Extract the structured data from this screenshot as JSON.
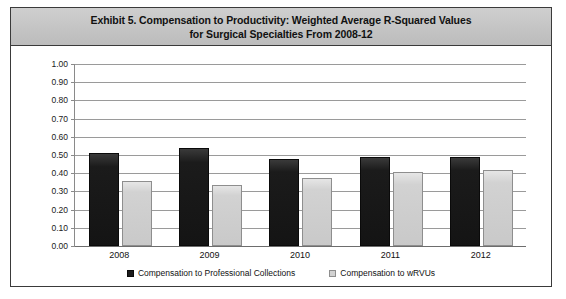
{
  "exhibit": {
    "title_line_1": "Exhibit 5. Compensation to Productivity: Weighted Average R-Squared Values",
    "title_line_2": "for Surgical Specialties From 2008-12"
  },
  "chart_data": {
    "type": "bar",
    "title": "Exhibit 5. Compensation to Productivity: Weighted Average R-Squared Values for Surgical Specialties From 2008-12",
    "xlabel": "",
    "ylabel": "",
    "ylim": [
      0.0,
      1.0
    ],
    "ytick_step": 0.1,
    "grid": true,
    "legend_position": "bottom",
    "categories": [
      "2008",
      "2009",
      "2010",
      "2011",
      "2012"
    ],
    "ytick_labels": [
      "1.00",
      "0.90",
      "0.80",
      "0.70",
      "0.60",
      "0.50",
      "0.40",
      "0.30",
      "0.20",
      "0.10",
      "0.00"
    ],
    "series": [
      {
        "name": "Compensation to Professional Collections",
        "color": "#1b1b1b",
        "values": [
          0.51,
          0.54,
          0.48,
          0.49,
          0.49
        ]
      },
      {
        "name": "Compensation to wRVUs",
        "color": "#d2d2d2",
        "values": [
          0.355,
          0.335,
          0.375,
          0.405,
          0.415
        ]
      }
    ]
  },
  "legend": {
    "entries": [
      {
        "label": "Compensation to Professional Collections",
        "swatch": "dark"
      },
      {
        "label": "Compensation to wRVUs",
        "swatch": "light"
      }
    ]
  }
}
